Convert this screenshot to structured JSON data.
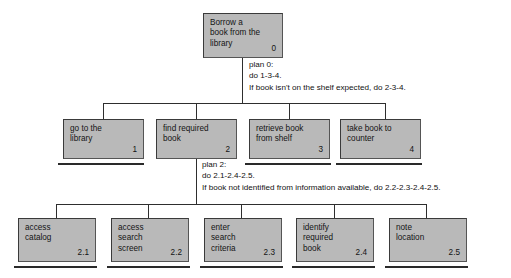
{
  "diagram": {
    "colors": {
      "box_fill": "#b9b9b9",
      "box_border": "#3a3a3a",
      "line": "#2e2e2e",
      "text": "#141414",
      "background": "#ffffff"
    },
    "root": {
      "label": "Borrow a\nbook from the\nlibrary",
      "number": "0"
    },
    "plans": [
      {
        "id": "plan-0",
        "text": "plan 0:\ndo 1-3-4.\nIf book isn't on the shelf expected, do 2-3-4."
      },
      {
        "id": "plan-2",
        "text": "plan 2:\ndo 2.1-2.4-2.5.\nIf book not identified from information available, do 2.2-2.3-2.4-2.5."
      }
    ],
    "level1": [
      {
        "label": "go to the\nlibrary",
        "number": "1",
        "leaf": true
      },
      {
        "label": "find required\nbook",
        "number": "2",
        "leaf": false
      },
      {
        "label": "retrieve book\nfrom shelf",
        "number": "3",
        "leaf": true
      },
      {
        "label": "take book to\ncounter",
        "number": "4",
        "leaf": true
      }
    ],
    "level2": [
      {
        "label": "access\ncatalog",
        "number": "2.1",
        "leaf": true
      },
      {
        "label": "access\nsearch\nscreen",
        "number": "2.2",
        "leaf": true
      },
      {
        "label": "enter\nsearch\ncriteria",
        "number": "2.3",
        "leaf": true
      },
      {
        "label": "identify\nrequired\nbook",
        "number": "2.4",
        "leaf": true
      },
      {
        "label": "note\nlocation",
        "number": "2.5",
        "leaf": true
      }
    ]
  }
}
